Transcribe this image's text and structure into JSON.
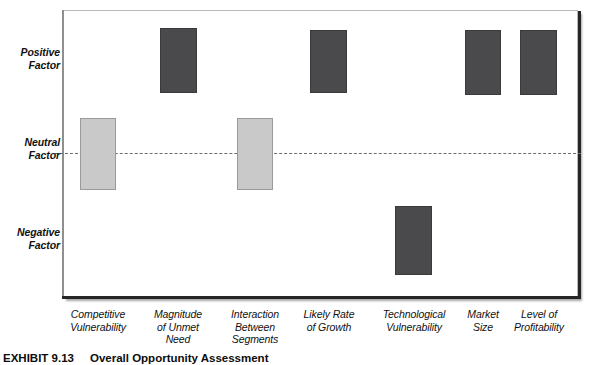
{
  "caption": {
    "number": "EXHIBIT 9.13",
    "title": "Overall Opportunity Assessment"
  },
  "chart_data": {
    "type": "bar",
    "title": "Overall Opportunity Assessment",
    "xlabel": "",
    "ylabel": "",
    "grid": false,
    "legend": "none",
    "y_axis": {
      "type": "categorical",
      "ticks": [
        "Positive Factor",
        "Neutral Factor",
        "Negative Factor"
      ],
      "tick_lines": [
        [
          "Positive",
          "Factor"
        ],
        [
          "Neutral",
          "Factor"
        ],
        [
          "Negative",
          "Factor"
        ]
      ],
      "baseline": "Neutral Factor",
      "baseline_style": "dashed"
    },
    "categories": [
      "Competitive Vulnerability",
      "Magnitude of Unmet Need",
      "Interaction Between Segments",
      "Likely Rate of Growth",
      "Technological Vulnerability",
      "Market Size",
      "Level of Profitability"
    ],
    "category_lines": [
      [
        "Competitive",
        "Vulnerability"
      ],
      [
        "Magnitude",
        "of Unmet",
        "Need"
      ],
      [
        "Interaction",
        "Between",
        "Segments"
      ],
      [
        "Likely Rate",
        "of Growth"
      ],
      [
        "Technological",
        "Vulnerability"
      ],
      [
        "Market",
        "Size"
      ],
      [
        "Level of",
        "Profitability"
      ]
    ],
    "ratings": [
      "Neutral Factor",
      "Positive Factor",
      "Neutral Factor",
      "Positive Factor",
      "Negative Factor",
      "Positive Factor",
      "Positive Factor"
    ],
    "bars": [
      {
        "category": "Competitive Vulnerability",
        "rating": "Neutral Factor",
        "shade": "neutral",
        "left": 80,
        "top": 118,
        "width": 36,
        "height": 72
      },
      {
        "category": "Magnitude of Unmet Need",
        "rating": "Positive Factor",
        "shade": "positive",
        "left": 160,
        "top": 28,
        "width": 37,
        "height": 65
      },
      {
        "category": "Interaction Between Segments",
        "rating": "Neutral Factor",
        "shade": "neutral",
        "left": 237,
        "top": 118,
        "width": 36,
        "height": 72
      },
      {
        "category": "Likely Rate of Growth",
        "rating": "Positive Factor",
        "shade": "positive",
        "left": 310,
        "top": 30,
        "width": 37,
        "height": 63
      },
      {
        "category": "Technological Vulnerability",
        "rating": "Negative Factor",
        "shade": "negative",
        "left": 395,
        "top": 206,
        "width": 37,
        "height": 69
      },
      {
        "category": "Market Size",
        "rating": "Positive Factor",
        "shade": "positive",
        "left": 465,
        "top": 30,
        "width": 36,
        "height": 65
      },
      {
        "category": "Level of Profitability",
        "rating": "Positive Factor",
        "shade": "positive",
        "left": 520,
        "top": 30,
        "width": 37,
        "height": 65
      }
    ]
  },
  "colors": {
    "positive_bar": "#4a4a4d",
    "negative_bar": "#4a4a4d",
    "neutral_bar": "#c9c9c9",
    "neutral_bar_border": "#9a9a9a",
    "baseline": "#6d6d6d",
    "frame": "#b9b9b9",
    "text": "#111111"
  },
  "axis_labels": {
    "y": [
      {
        "line1": "Positive",
        "line2": "Factor",
        "top": 46
      },
      {
        "line1": "Neutral",
        "line2": "Factor",
        "top": 136
      },
      {
        "line1": "Negative",
        "line2": "Factor",
        "top": 226
      }
    ],
    "x": [
      {
        "line1": "Competitive",
        "line2": "Vulnerability",
        "line3": "",
        "center": 98,
        "width": 84
      },
      {
        "line1": "Magnitude",
        "line2": "of Unmet",
        "line3": "Need",
        "center": 178,
        "width": 84
      },
      {
        "line1": "Interaction",
        "line2": "Between",
        "line3": "Segments",
        "center": 255,
        "width": 84
      },
      {
        "line1": "Likely Rate",
        "line2": "of Growth",
        "line3": "",
        "center": 329,
        "width": 84
      },
      {
        "line1": "Technological",
        "line2": "Vulnerability",
        "line3": "",
        "center": 414,
        "width": 90
      },
      {
        "line1": "Market",
        "line2": "Size",
        "line3": "",
        "center": 483,
        "width": 70
      },
      {
        "line1": "Level of",
        "line2": "Profitability",
        "line3": "",
        "center": 539,
        "width": 86
      }
    ]
  }
}
